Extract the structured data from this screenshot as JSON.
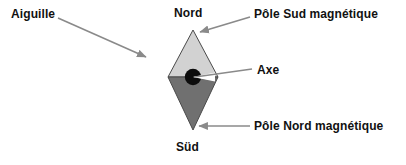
{
  "figure": {
    "width": 406,
    "height": 165,
    "background": "#ffffff"
  },
  "labels": {
    "aiguille": "Aiguille",
    "nord": "Nord",
    "sud": "Süd",
    "pole_sud_magnetique": "Pôle Sud magnétique",
    "axe": "Axe",
    "pole_nord_magnetique": "Pôle Nord magnétique"
  },
  "colors": {
    "needle_north_fill": "#d2d2d2",
    "needle_south_fill": "#707070",
    "needle_outline": "#4a4a4a",
    "pivot_fill": "#0c0c0c",
    "arrow": "#8a8a8a",
    "leader": "#8a8a8a",
    "text": "#111111",
    "background": "#ffffff"
  },
  "needle": {
    "shape": "rhombus",
    "top_apex": [
      193,
      30
    ],
    "bottom_apex": [
      193,
      130
    ],
    "left_vertex": [
      168,
      77
    ],
    "right_vertex": [
      218,
      77
    ],
    "pivot_center": [
      193,
      77
    ],
    "pivot_radius": 8
  },
  "annotations": [
    {
      "name": "aiguille",
      "label": "Aiguille",
      "connector": "arrow",
      "from": [
        58,
        18
      ],
      "to": [
        148,
        58
      ]
    },
    {
      "name": "pole-sud-magnetique",
      "label": "Pôle Sud magnétique",
      "connector": "arrow",
      "from": [
        250,
        17
      ],
      "to": [
        198,
        33
      ]
    },
    {
      "name": "axe",
      "label": "Axe",
      "connector": "line",
      "from": [
        252,
        69
      ],
      "to": [
        193,
        77
      ]
    },
    {
      "name": "pole-nord-magnetique",
      "label": "Pôle Nord magnétique",
      "connector": "arrow",
      "from": [
        250,
        126
      ],
      "to": [
        197,
        126
      ]
    }
  ]
}
